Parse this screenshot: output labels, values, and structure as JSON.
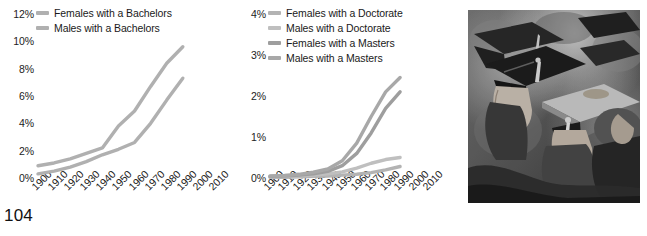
{
  "page": {
    "number": "104"
  },
  "chart_data": [
    {
      "id": "bachelors",
      "type": "line",
      "title": "",
      "xlabel": "",
      "ylabel": "",
      "x": [
        1900,
        1910,
        1920,
        1930,
        1940,
        1950,
        1960,
        1970,
        1980,
        1990,
        2000,
        2010
      ],
      "xlim": [
        1900,
        2010
      ],
      "ylim": [
        0,
        12
      ],
      "yticks": [
        "0%",
        "2%",
        "4%",
        "6%",
        "8%",
        "10%",
        "12%"
      ],
      "ytick_values": [
        0,
        2,
        4,
        6,
        8,
        10,
        12
      ],
      "xticks": [
        "1900",
        "1910",
        "1920",
        "1930",
        "1940",
        "1950",
        "1960",
        "1970",
        "1980",
        "1990",
        "2000",
        "2010"
      ],
      "grid": false,
      "legend_position": "top-left",
      "series": [
        {
          "name": "Females with a Bachelors",
          "color": "#b0b0b0",
          "values": [
            0.9,
            1.1,
            1.4,
            1.8,
            2.2,
            3.8,
            4.9,
            6.7,
            8.4,
            9.6,
            null,
            null
          ]
        },
        {
          "name": "Males with a Bachelors",
          "color": "#b0b0b0",
          "values": [
            0.3,
            0.5,
            0.8,
            1.2,
            1.7,
            2.1,
            2.6,
            4.0,
            5.7,
            7.3,
            null,
            null
          ]
        }
      ]
    },
    {
      "id": "graduate",
      "type": "line",
      "title": "",
      "xlabel": "",
      "ylabel": "",
      "x": [
        1900,
        1910,
        1920,
        1930,
        1940,
        1950,
        1960,
        1970,
        1980,
        1990,
        2000,
        2010
      ],
      "xlim": [
        1900,
        2010
      ],
      "ylim": [
        0,
        4
      ],
      "yticks": [
        "0%",
        "1%",
        "2%",
        "3%",
        "4%"
      ],
      "ytick_values": [
        0,
        1,
        2,
        3,
        4
      ],
      "xticks": [
        "1900",
        "1910",
        "1920",
        "1930",
        "1940",
        "1950",
        "1960",
        "1970",
        "1980",
        "1990",
        "2000",
        "2010"
      ],
      "grid": false,
      "legend_position": "top-left",
      "series": [
        {
          "name": "Females with a Doctorate",
          "color": "#b3b3b3",
          "values": [
            0.02,
            0.02,
            0.03,
            0.04,
            0.05,
            0.07,
            0.09,
            0.13,
            0.2,
            0.28,
            null,
            null
          ]
        },
        {
          "name": "Males with a Doctorate",
          "color": "#bfbfbf",
          "values": [
            0.03,
            0.04,
            0.05,
            0.07,
            0.1,
            0.15,
            0.24,
            0.36,
            0.45,
            0.5,
            null,
            null
          ]
        },
        {
          "name": "Females with a Masters",
          "color": "#9e9e9e",
          "values": [
            0.04,
            0.05,
            0.07,
            0.1,
            0.16,
            0.3,
            0.6,
            1.1,
            1.7,
            2.1,
            null,
            null
          ]
        },
        {
          "name": "Males with a Masters",
          "color": "#a8a8a8",
          "values": [
            0.05,
            0.06,
            0.09,
            0.14,
            0.22,
            0.42,
            0.85,
            1.5,
            2.1,
            2.45,
            null,
            null
          ]
        }
      ]
    }
  ],
  "photo": {
    "caption": "",
    "alt_name": "graduation-ceremony-photo"
  }
}
